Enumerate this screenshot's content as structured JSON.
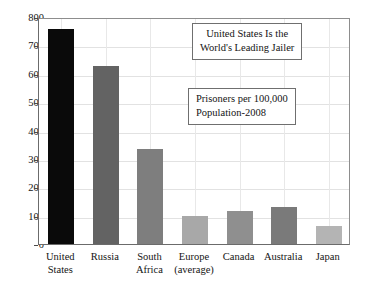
{
  "chart_data": {
    "type": "bar",
    "title": "",
    "xlabel": "",
    "ylabel": "",
    "ylim": [
      0,
      800
    ],
    "ytick_step": 100,
    "grid": true,
    "legend": null,
    "categories": [
      "United States",
      "Russia",
      "South Africa",
      "Europe (average)",
      "Canada",
      "Australia",
      "Japan"
    ],
    "values": [
      757,
      627,
      335,
      100,
      116,
      129,
      63
    ],
    "yticks": [
      "0",
      "100",
      "200",
      "300",
      "400",
      "500",
      "600",
      "700",
      "800"
    ],
    "bar_colors": [
      "#0a0a0a",
      "#636363",
      "#7e7e7e",
      "#a8a8a8",
      "#8f8f8f",
      "#7a7a7a",
      "#b4b4b4"
    ],
    "annotations": [
      {
        "name": "leading-jailer",
        "lines": [
          "United States Is the",
          "World's Leading Jailer"
        ]
      },
      {
        "name": "units",
        "lines": [
          "Prisoners per 100,000",
          "Population-2008"
        ]
      }
    ],
    "category_label_lines": [
      [
        "United",
        "States"
      ],
      [
        "Russia"
      ],
      [
        "South",
        "Africa"
      ],
      [
        "Europe",
        "(average)"
      ],
      [
        "Canada"
      ],
      [
        "Australia"
      ],
      [
        "Japan"
      ]
    ]
  },
  "axis": {
    "y_ticks": [
      {
        "value": 800,
        "label": "800"
      },
      {
        "value": 700,
        "label": "700"
      },
      {
        "value": 600,
        "label": "600"
      },
      {
        "value": 500,
        "label": "500"
      },
      {
        "value": 400,
        "label": "400"
      },
      {
        "value": 300,
        "label": "300"
      },
      {
        "value": 200,
        "label": "200"
      },
      {
        "value": 100,
        "label": "100"
      },
      {
        "value": 0,
        "label": "0"
      }
    ]
  },
  "annotations": {
    "title_box": {
      "line1": "United States Is the",
      "line2": "World's Leading Jailer"
    },
    "units_box": {
      "line1": "Prisoners per 100,000",
      "line2": "Population-2008"
    }
  },
  "colors": {
    "axis": "#6b6b6b",
    "grid": "#e2e2e2",
    "text": "#141414",
    "background": "#ffffff"
  }
}
